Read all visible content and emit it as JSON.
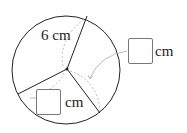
{
  "diagram": {
    "radius_label": "6 cm",
    "answer_boxes": [
      {
        "unit": "cm",
        "value": ""
      },
      {
        "unit": "cm",
        "value": ""
      }
    ],
    "colors": {
      "stroke": "#222222",
      "guide": "#aaaaaa"
    }
  }
}
